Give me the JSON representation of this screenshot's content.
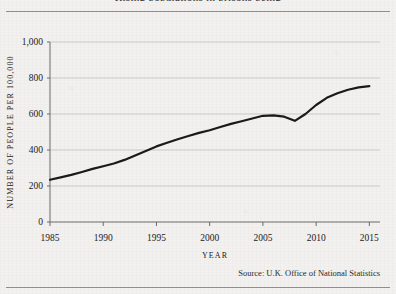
{
  "figure": {
    "title_clipped": "Rising populations in prisons being",
    "source": "Source: U.K. Office of National Statistics"
  },
  "chart_data": {
    "type": "line",
    "title": "",
    "xlabel": "YEAR",
    "ylabel": "NUMBER OF PEOPLE PER 100,000",
    "xlim": [
      1985,
      2016
    ],
    "ylim": [
      0,
      1000
    ],
    "grid": true,
    "legend": "none",
    "xticks": [
      "1985",
      "1990",
      "1995",
      "2000",
      "2005",
      "2010",
      "2015"
    ],
    "xtick_values": [
      1985,
      1990,
      1995,
      2000,
      2005,
      2010,
      2015
    ],
    "yticks": [
      "0",
      "200",
      "400",
      "600",
      "800",
      "1,000"
    ],
    "ytick_values": [
      0,
      200,
      400,
      600,
      800,
      1000
    ],
    "line_color": "#1a1a1a",
    "line_width": 2.2,
    "series": [
      {
        "name": "People per 100,000",
        "x": [
          1985,
          1986,
          1987,
          1988,
          1989,
          1990,
          1991,
          1992,
          1993,
          1994,
          1995,
          1996,
          1997,
          1998,
          1999,
          2000,
          2001,
          2002,
          2003,
          2004,
          2005,
          2006,
          2007,
          2008,
          2009,
          2010,
          2011,
          2012,
          2013,
          2014,
          2015
        ],
        "values": [
          235,
          248,
          262,
          278,
          295,
          310,
          325,
          345,
          370,
          395,
          420,
          440,
          460,
          478,
          495,
          510,
          528,
          545,
          560,
          575,
          590,
          592,
          585,
          562,
          600,
          650,
          690,
          715,
          735,
          748,
          755
        ]
      }
    ]
  }
}
